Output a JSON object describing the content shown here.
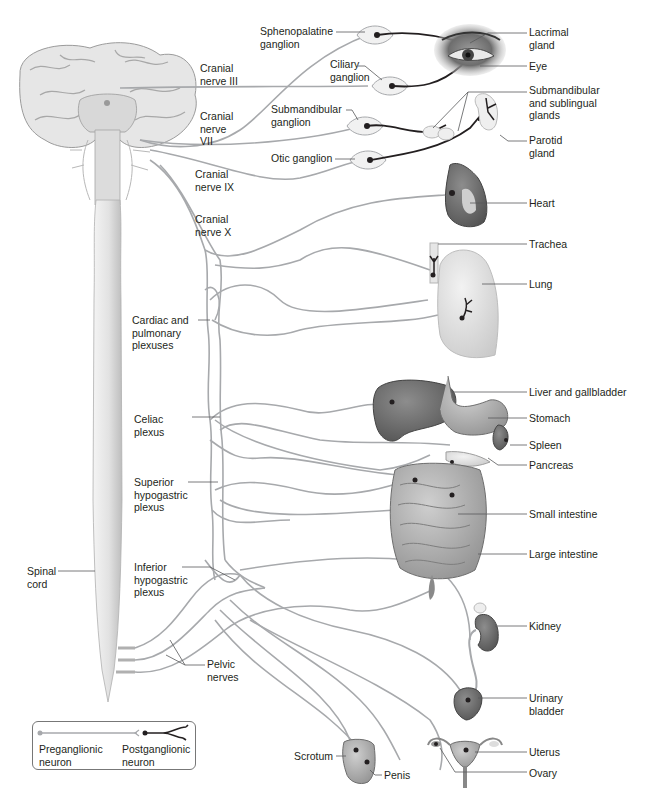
{
  "diagram": {
    "colors": {
      "preganglionic": "#a7a9ac",
      "postganglionic": "#231f20",
      "leader": "#58595b",
      "text": "#231f20"
    },
    "structures": {
      "brain": "brain",
      "spinal_cord": "Spinal\ncord"
    },
    "cranial_nerves": {
      "iii": "Cranial\nnerve III",
      "vii": "Cranial\nnerve\nVII",
      "ix": "Cranial\nnerve IX",
      "x": "Cranial\nnerve X"
    },
    "ganglia": {
      "sphenopalatine": "Sphenopalatine\nganglion",
      "ciliary": "Ciliary\nganglion",
      "submandibular": "Submandibular\nganglion",
      "otic": "Otic ganglion"
    },
    "plexuses": {
      "cardiac_pulmonary": "Cardiac and\npulmonary\nplexuses",
      "celiac": "Celiac\nplexus",
      "superior_hypogastric": "Superior\nhypogastric\nplexus",
      "inferior_hypogastric": "Inferior\nhypogastric\nplexus",
      "pelvic_nerves": "Pelvic\nnerves"
    },
    "organs": {
      "lacrimal_gland": "Lacrimal\ngland",
      "eye": "Eye",
      "submandibular_sublingual": "Submandibular\nand sublingual\nglands",
      "parotid": "Parotid\ngland",
      "heart": "Heart",
      "trachea": "Trachea",
      "lung": "Lung",
      "liver": "Liver and gallbladder",
      "stomach": "Stomach",
      "spleen": "Spleen",
      "pancreas": "Pancreas",
      "small_intestine": "Small intestine",
      "large_intestine": "Large intestine",
      "kidney": "Kidney",
      "bladder": "Urinary\nbladder",
      "uterus": "Uterus",
      "ovary": "Ovary",
      "scrotum": "Scrotum",
      "penis": "Penis"
    },
    "legend": {
      "preganglionic": "Preganglionic\nneuron",
      "postganglionic": "Postganglionic\nneuron"
    }
  }
}
